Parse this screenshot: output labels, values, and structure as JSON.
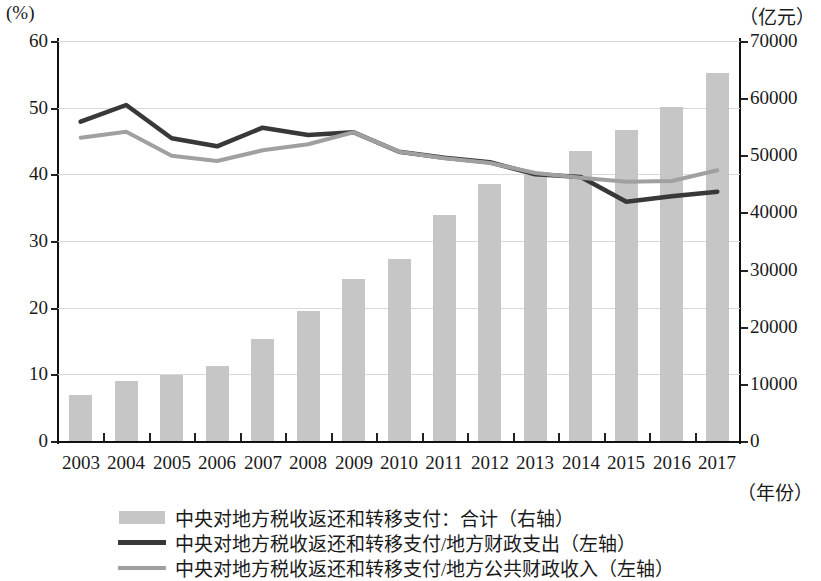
{
  "axes": {
    "left_unit": "(%)",
    "right_unit": "（亿元）",
    "x_unit": "（年份）",
    "left_ticks": [
      "0",
      "10",
      "20",
      "30",
      "40",
      "50",
      "60"
    ],
    "right_ticks": [
      "0",
      "10000",
      "20000",
      "30000",
      "40000",
      "50000",
      "60000",
      "70000"
    ]
  },
  "legend": {
    "items": [
      {
        "key": "bar",
        "label": "中央对地方税收返还和转移支付：合计（右轴）"
      },
      {
        "key": "dark",
        "label": "中央对地方税收返还和转移支付/地方财政支出（左轴）"
      },
      {
        "key": "gray",
        "label": "中央对地方税收返还和转移支付/地方公共财政收入（左轴）"
      }
    ]
  },
  "chart_data": {
    "type": "bar",
    "title": "",
    "xlabel": "（年份）",
    "ylabel": "(%)",
    "y2label": "（亿元）",
    "ylim": [
      0,
      60
    ],
    "y2lim": [
      0,
      70000
    ],
    "grid": true,
    "legend_position": "bottom",
    "categories": [
      "2003",
      "2004",
      "2005",
      "2006",
      "2007",
      "2008",
      "2009",
      "2010",
      "2011",
      "2012",
      "2013",
      "2014",
      "2015",
      "2016",
      "2017"
    ],
    "series": [
      {
        "name": "中央对地方税收返还和转移支付：合计（右轴）",
        "type": "bar",
        "axis": "right",
        "unit": "亿元",
        "color": "#c6c6c6",
        "values": [
          8000,
          10500,
          11600,
          13200,
          17800,
          22700,
          28300,
          31900,
          39500,
          45000,
          46600,
          50700,
          54500,
          58500,
          64400
        ]
      },
      {
        "name": "中央对地方税收返还和转移支付/地方财政支出（左轴）",
        "type": "line",
        "axis": "left",
        "unit": "%",
        "color": "#383838",
        "values": [
          47.9,
          50.4,
          45.4,
          44.2,
          47.0,
          45.9,
          46.3,
          43.4,
          42.5,
          41.8,
          40.0,
          39.6,
          35.9,
          36.7,
          37.4
        ]
      },
      {
        "name": "中央对地方税收返还和转移支付/地方公共财政收入（左轴）",
        "type": "line",
        "axis": "left",
        "unit": "%",
        "color": "#a0a0a0",
        "values": [
          45.5,
          46.4,
          42.8,
          42.0,
          43.6,
          44.5,
          46.3,
          43.4,
          42.4,
          41.7,
          40.2,
          39.5,
          38.9,
          39.0,
          40.6
        ]
      }
    ]
  }
}
